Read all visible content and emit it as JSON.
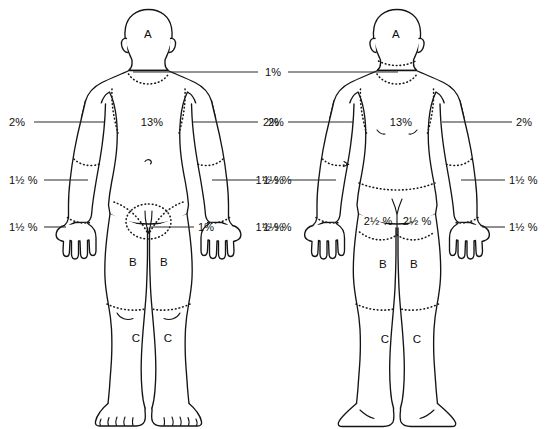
{
  "diagram": {
    "figures": [
      {
        "id": "anterior",
        "view_label": "anterior"
      },
      {
        "id": "posterior",
        "view_label": "posterior"
      }
    ],
    "ink_color": "#141414",
    "background_color": "#ffffff"
  },
  "anterior": {
    "head_label": "A",
    "trunk_pct": "13%",
    "left_outer_upper_arm_pct": "2%",
    "left_outer_forearm_pct": "1½ %",
    "left_hand_pct": "1½ %",
    "right_outer_upper_arm_pct": "2%",
    "right_outer_forearm_pct": "1½ %",
    "right_hand_pct": "1½ %",
    "genitalia_pct": "1%",
    "thigh_left_label": "B",
    "thigh_right_label": "B",
    "leg_left_label": "C",
    "leg_right_label": "C"
  },
  "posterior": {
    "head_label": "A",
    "trunk_pct": "13%",
    "left_outer_upper_arm_pct": "2%",
    "left_outer_forearm_pct": "1½ %",
    "left_hand_pct": "1½ %",
    "right_outer_upper_arm_pct": "2%",
    "right_outer_forearm_pct": "1½ %",
    "right_hand_pct": "1½ %",
    "buttock_left_pct": "2½ %",
    "buttock_right_pct": "2½ %",
    "thigh_left_label": "B",
    "thigh_right_label": "B",
    "leg_left_label": "C",
    "leg_right_label": "C"
  },
  "shared": {
    "neck_pct": "1%"
  }
}
